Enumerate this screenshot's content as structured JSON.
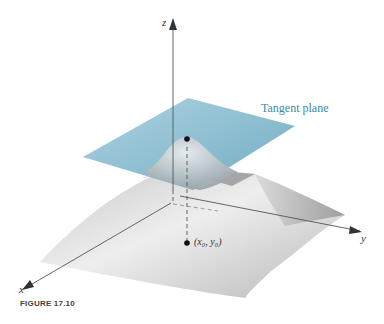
{
  "figure": {
    "caption": "FIGURE 17.10",
    "labels": {
      "z_axis": "z",
      "y_axis": "y",
      "x_axis": "x",
      "tangent_plane": "Tangent plane",
      "point_base": "(x₀, y₀)"
    },
    "colors": {
      "plane": "#7fb6cc",
      "plane_label": "#3a8ba8",
      "surface_light": "#f0f0f0",
      "surface_dark": "#9a9a9a",
      "axis": "#555555"
    }
  }
}
